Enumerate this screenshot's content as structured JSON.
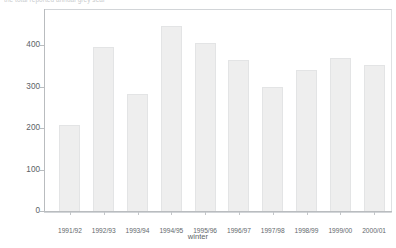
{
  "caption": {
    "text": "the total reported annual grey seal"
  },
  "chart_data": {
    "type": "bar",
    "title": "",
    "subtitle": "",
    "xlabel": "winter",
    "ylabel": "numbers",
    "categories": [
      "1991/92",
      "1992/93",
      "1993/94",
      "1994/95",
      "1995/96",
      "1996/97",
      "1997/98",
      "1998/99",
      "1999/00",
      "2000/01"
    ],
    "values": [
      207,
      396,
      282,
      445,
      405,
      365,
      300,
      340,
      368,
      352
    ],
    "ylim": [
      0,
      470
    ],
    "yticks": [
      0,
      100,
      200,
      300,
      400
    ],
    "ytick_labels": [
      "0",
      "100",
      "200",
      "300",
      "400"
    ],
    "grid": false,
    "legend": null,
    "bar_color": "#eeeeee",
    "bar_edge_color": "#e3e4e5",
    "axis_color": "#b9bcbf"
  }
}
